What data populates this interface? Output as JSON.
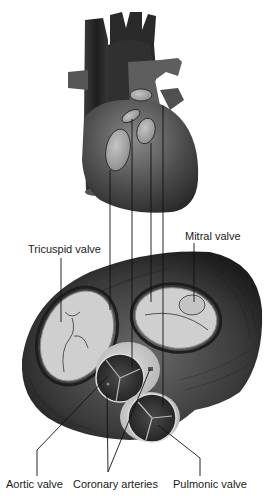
{
  "figure": {
    "labels": {
      "tricuspid": "Tricuspid valve",
      "mitral": "Mitral valve",
      "aortic": "Aortic valve",
      "coronary": "Coronary arteries",
      "pulmonic": "Pulmonic valve"
    },
    "colors": {
      "background": "#ffffff",
      "heart_dark": "#2e2e2e",
      "heart_mid": "#5a5a5a",
      "valve_light": "#c8c8c8",
      "leader_line": "#111111"
    }
  }
}
